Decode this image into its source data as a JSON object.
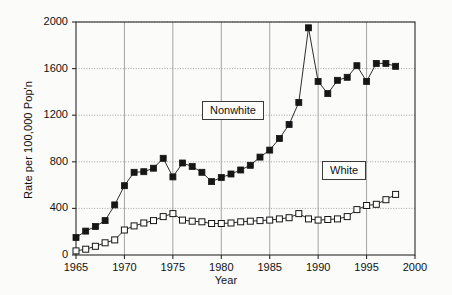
{
  "chart_data": {
    "type": "line",
    "title": "",
    "xlabel": "Year",
    "ylabel": "Rate per 100,000 Pop'n",
    "xlim": [
      1965,
      2000
    ],
    "ylim": [
      0,
      2000
    ],
    "xticks": [
      1965,
      1970,
      1975,
      1980,
      1985,
      1990,
      1995,
      2000
    ],
    "yticks": [
      0,
      400,
      800,
      1200,
      1600,
      2000
    ],
    "grid": true,
    "legend_position": "inline-labels",
    "x": [
      1965,
      1966,
      1967,
      1968,
      1969,
      1970,
      1971,
      1972,
      1973,
      1974,
      1975,
      1976,
      1977,
      1978,
      1979,
      1980,
      1981,
      1982,
      1983,
      1984,
      1985,
      1986,
      1987,
      1988,
      1989,
      1990,
      1991,
      1992,
      1993,
      1994,
      1995,
      1996,
      1997,
      1998
    ],
    "series": [
      {
        "name": "Nonwhite",
        "marker": "filled-square",
        "color": "#161616",
        "values": [
          150,
          205,
          245,
          295,
          430,
          595,
          710,
          715,
          745,
          830,
          670,
          790,
          760,
          710,
          630,
          665,
          695,
          730,
          770,
          840,
          900,
          1000,
          1120,
          1310,
          1950,
          1490,
          1385,
          1500,
          1525,
          1625,
          1490,
          1645,
          1645,
          1620
        ]
      },
      {
        "name": "White",
        "marker": "open-square",
        "color": "#161616",
        "values": [
          35,
          50,
          75,
          105,
          130,
          215,
          250,
          275,
          295,
          330,
          355,
          300,
          290,
          285,
          270,
          270,
          275,
          285,
          290,
          295,
          300,
          310,
          320,
          355,
          310,
          300,
          305,
          310,
          330,
          390,
          425,
          435,
          475,
          520
        ]
      }
    ],
    "annotations": [
      {
        "label": "Nonwhite",
        "x": 1982,
        "y": 1180
      },
      {
        "label": "White",
        "x": 1993,
        "y": 790
      }
    ]
  }
}
